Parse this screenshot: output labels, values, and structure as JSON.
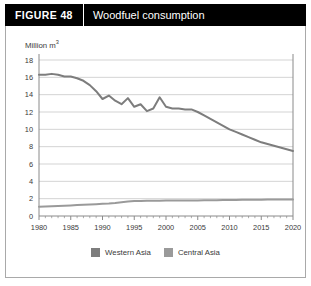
{
  "header": {
    "figure_label": "FIGURE  48",
    "title": "Woodfuel consumption"
  },
  "chart_data": {
    "type": "line",
    "title": "Woodfuel consumption",
    "xlabel": "",
    "ylabel": "Million m³",
    "ylabel_text": "Million m",
    "ylabel_sup": "3",
    "xlim": [
      1980,
      2020
    ],
    "ylim": [
      0,
      18
    ],
    "yticks": [
      0,
      2,
      4,
      6,
      8,
      10,
      12,
      14,
      16,
      18
    ],
    "xticks": [
      1980,
      1985,
      1990,
      1995,
      2000,
      2005,
      2010,
      2015,
      2020
    ],
    "grid": true,
    "legend_position": "bottom",
    "colors": {
      "western_asia": "#7d7d7d",
      "central_asia": "#9a9a9a",
      "grid": "#c8c8c8",
      "axis": "#8a8a8a",
      "header_bg": "#000000",
      "header_text": "#ffffff",
      "frame": "#a9a9a9",
      "text": "#3a3a3a"
    },
    "x": [
      1980,
      1981,
      1982,
      1983,
      1984,
      1985,
      1986,
      1987,
      1988,
      1989,
      1990,
      1991,
      1992,
      1993,
      1994,
      1995,
      1996,
      1997,
      1998,
      1999,
      2000,
      2001,
      2002,
      2003,
      2004,
      2005,
      2006,
      2007,
      2008,
      2009,
      2010,
      2011,
      2012,
      2013,
      2014,
      2015,
      2016,
      2017,
      2018,
      2019,
      2020
    ],
    "series": [
      {
        "name": "Western Asia",
        "color": "#7d7d7d",
        "values": [
          16.3,
          16.3,
          16.4,
          16.3,
          16.1,
          16.1,
          15.9,
          15.6,
          15.1,
          14.4,
          13.5,
          13.9,
          13.3,
          12.9,
          13.6,
          12.6,
          12.9,
          12.1,
          12.4,
          13.7,
          12.6,
          12.4,
          12.4,
          12.3,
          12.3,
          12.0,
          11.6,
          11.2,
          10.8,
          10.4,
          10.0,
          9.7,
          9.4,
          9.1,
          8.8,
          8.5,
          8.3,
          8.1,
          7.9,
          7.7,
          7.5
        ]
      },
      {
        "name": "Central Asia",
        "color": "#9a9a9a",
        "values": [
          1.08,
          1.1,
          1.12,
          1.15,
          1.18,
          1.22,
          1.26,
          1.3,
          1.33,
          1.36,
          1.4,
          1.44,
          1.5,
          1.58,
          1.66,
          1.72,
          1.74,
          1.75,
          1.76,
          1.77,
          1.78,
          1.78,
          1.79,
          1.79,
          1.8,
          1.8,
          1.81,
          1.82,
          1.83,
          1.84,
          1.85,
          1.86,
          1.87,
          1.87,
          1.88,
          1.88,
          1.89,
          1.89,
          1.9,
          1.9,
          1.91
        ]
      }
    ],
    "legend": [
      {
        "label": "Western Asia",
        "color": "#7d7d7d"
      },
      {
        "label": "Central Asia",
        "color": "#9a9a9a"
      }
    ]
  }
}
